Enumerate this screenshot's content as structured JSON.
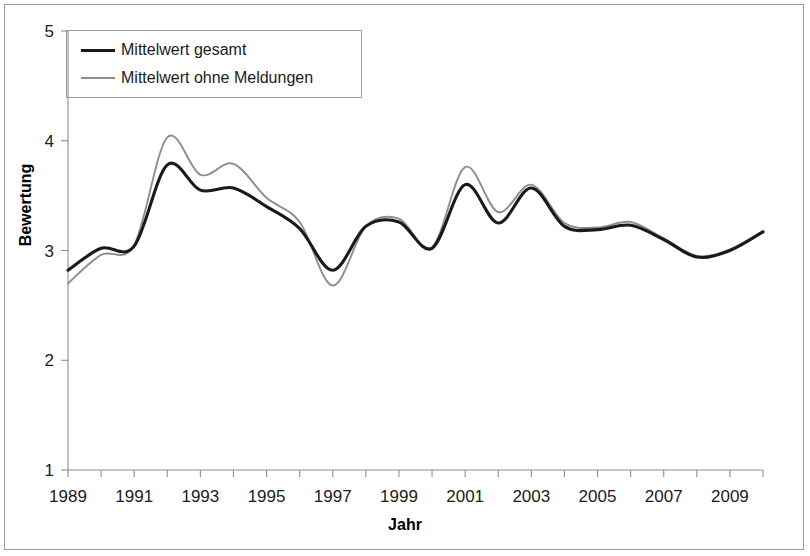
{
  "chart_data": {
    "type": "line",
    "title": "",
    "xlabel": "Jahr",
    "ylabel": "Bewertung",
    "xlim": [
      1989,
      2010
    ],
    "ylim": [
      1,
      5
    ],
    "grid": false,
    "legend_position": "top-left",
    "y_ticks": [
      "1",
      "2",
      "3",
      "4",
      "5"
    ],
    "y_tick_values": [
      1,
      2,
      3,
      4,
      5
    ],
    "x_ticks": [
      "1989",
      "1991",
      "1993",
      "1995",
      "1997",
      "1999",
      "2001",
      "2003",
      "2005",
      "2007",
      "2009"
    ],
    "x_tick_values": [
      1989,
      1991,
      1993,
      1995,
      1997,
      1999,
      2001,
      2003,
      2005,
      2007,
      2009
    ],
    "x_minor_tick_values": [
      1990,
      1992,
      1994,
      1996,
      1998,
      2000,
      2002,
      2004,
      2006,
      2008,
      2010
    ],
    "x": [
      1989,
      1990,
      1991,
      1992,
      1993,
      1994,
      1995,
      1996,
      1997,
      1998,
      1999,
      2000,
      2001,
      2002,
      2003,
      2004,
      2005,
      2006,
      2007,
      2008,
      2009,
      2010
    ],
    "series": [
      {
        "name": "Mittelwert gesamt",
        "color": "#1a1a1a",
        "width": 3.1,
        "values": [
          2.82,
          3.02,
          3.04,
          3.78,
          3.55,
          3.57,
          3.4,
          3.2,
          2.82,
          3.22,
          3.26,
          3.02,
          3.6,
          3.25,
          3.57,
          3.22,
          3.19,
          3.23,
          3.1,
          2.94,
          3.0,
          3.17
        ]
      },
      {
        "name": "Mittelwert ohne Meldungen",
        "color": "#8e8e8e",
        "width": 1.9,
        "values": [
          2.7,
          2.96,
          3.05,
          4.03,
          3.69,
          3.79,
          3.48,
          3.26,
          2.68,
          3.22,
          3.29,
          3.03,
          3.76,
          3.35,
          3.6,
          3.25,
          3.21,
          3.26,
          3.11,
          2.95,
          3.01,
          3.18
        ]
      }
    ]
  },
  "legend": {
    "entries": [
      {
        "label": "Mittelwert gesamt"
      },
      {
        "label": "Mittelwert ohne Meldungen"
      }
    ]
  },
  "axes": {
    "y_title": "Bewertung",
    "x_title": "Jahr"
  }
}
